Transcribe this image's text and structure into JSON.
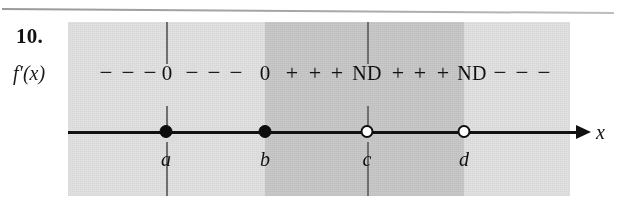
{
  "figure": {
    "problem_number": "10.",
    "function_label": "f′(x)",
    "axis_variable": "x"
  },
  "sign_row": {
    "entries": [
      {
        "text": "−",
        "x": 38,
        "kind": "minus"
      },
      {
        "text": "−",
        "x": 60,
        "kind": "minus"
      },
      {
        "text": "−",
        "x": 82,
        "kind": "minus"
      },
      {
        "text": "0",
        "x": 99,
        "kind": "zero"
      },
      {
        "text": "−",
        "x": 124,
        "kind": "minus"
      },
      {
        "text": "−",
        "x": 146,
        "kind": "minus"
      },
      {
        "text": "−",
        "x": 168,
        "kind": "minus"
      },
      {
        "text": "0",
        "x": 197,
        "kind": "zero"
      },
      {
        "text": "+",
        "x": 224,
        "kind": "plus"
      },
      {
        "text": "+",
        "x": 247,
        "kind": "plus"
      },
      {
        "text": "+",
        "x": 269,
        "kind": "plus"
      },
      {
        "text": "ND",
        "x": 299,
        "kind": "nd"
      },
      {
        "text": "+",
        "x": 330,
        "kind": "plus"
      },
      {
        "text": "+",
        "x": 352,
        "kind": "plus"
      },
      {
        "text": "+",
        "x": 375,
        "kind": "plus"
      },
      {
        "text": "ND",
        "x": 404,
        "kind": "nd"
      },
      {
        "text": "−",
        "x": 432,
        "kind": "minus"
      },
      {
        "text": "−",
        "x": 454,
        "kind": "minus"
      },
      {
        "text": "−",
        "x": 476,
        "kind": "minus"
      }
    ]
  },
  "points": [
    {
      "label": "a",
      "x": 166,
      "type": "filled",
      "gridline": true
    },
    {
      "label": "b",
      "x": 265,
      "type": "filled",
      "gridline": false
    },
    {
      "label": "c",
      "x": 367,
      "type": "open",
      "gridline": true
    },
    {
      "label": "d",
      "x": 464,
      "type": "open",
      "gridline": false
    }
  ],
  "bands": [
    {
      "name": "band-left",
      "left": 0,
      "width": 197,
      "shade": "light"
    },
    {
      "name": "band-middle",
      "left": 197,
      "width": 199,
      "shade": "dark"
    },
    {
      "name": "band-right",
      "left": 396,
      "width": 106,
      "shade": "light"
    }
  ],
  "colors": {
    "band_light": "#e2e2e2",
    "band_dark": "#c9c9c9",
    "ink": "#111111",
    "gridline": "#6f6f6f",
    "page": "#ffffff"
  }
}
